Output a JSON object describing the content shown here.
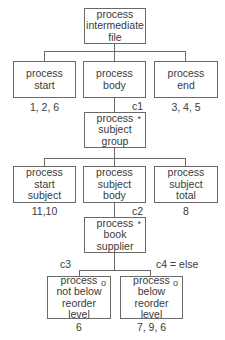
{
  "nodes": {
    "root": {
      "label": "process\nintermediate\nfile"
    },
    "start": {
      "label": "process\nstart",
      "annotation": "1, 2, 6"
    },
    "body": {
      "label": "process\nbody"
    },
    "end": {
      "label": "process\nend",
      "annotation": "3, 4, 5"
    },
    "subject_group": {
      "label": "process\nsubject\ngroup",
      "marker": "*",
      "condition": "c1"
    },
    "start_subject": {
      "label": "process\nstart\nsubject",
      "annotation": "11,10"
    },
    "subject_body": {
      "label": "process\nsubject\nbody"
    },
    "subject_total": {
      "label": "process\nsubject\ntotal",
      "annotation": "8"
    },
    "book_supplier": {
      "label": "process\nbook\nsupplier",
      "marker": "*",
      "condition": "c2"
    },
    "not_below": {
      "label": "process\nnot below\nreorder\nlevel",
      "marker": "o",
      "condition": "c3",
      "annotation": "6"
    },
    "below": {
      "label": "process\nbelow\nreorder\nlevel",
      "marker": "o",
      "condition": "c4 = else",
      "annotation": "7, 9, 6"
    }
  }
}
